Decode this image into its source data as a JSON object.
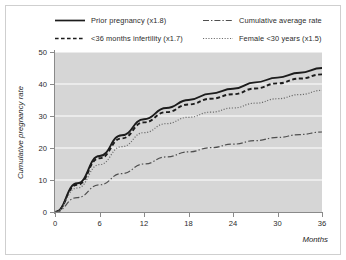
{
  "chart_data": {
    "type": "line",
    "title": "",
    "xlabel": "Months",
    "ylabel": "Cumulative pregnancy rate",
    "xlim": [
      0,
      36
    ],
    "ylim": [
      0,
      50
    ],
    "xticks": [
      0,
      6,
      12,
      18,
      24,
      30,
      36
    ],
    "yticks": [
      0,
      10,
      20,
      30,
      40,
      50
    ],
    "x": [
      0,
      3,
      6,
      9,
      12,
      15,
      18,
      21,
      24,
      27,
      30,
      33,
      36
    ],
    "grid": true,
    "grid_color": "#ffffff",
    "plot_background": "#d6d6d6",
    "legend_position": "top",
    "series": [
      {
        "name": "Prior pregnancy (x1.8)",
        "style": "solid",
        "color": "#1c1c1c",
        "values": [
          0,
          9,
          17.5,
          24,
          29,
          32.5,
          35,
          37,
          38.5,
          40.5,
          42,
          43.5,
          45
        ]
      },
      {
        "name": "<36 months infertility (x1.7)",
        "style": "dashed",
        "color": "#1c1c1c",
        "values": [
          0,
          8.5,
          16.8,
          23,
          28,
          31.2,
          33.6,
          35.4,
          36.8,
          38.6,
          40.2,
          41.7,
          43
        ]
      },
      {
        "name": "Cumulative average rate",
        "style": "dashdot",
        "color": "#4f4f4f",
        "values": [
          0,
          4.5,
          8.5,
          12,
          15,
          17.2,
          18.8,
          20.1,
          21.2,
          22.3,
          23.3,
          24.2,
          25
        ]
      },
      {
        "name": "Female <30 years (x1.5)",
        "style": "dotted",
        "color": "#6b6b6b",
        "values": [
          0,
          7.5,
          14.8,
          20.4,
          24.8,
          27.6,
          29.6,
          31.2,
          32.5,
          34.0,
          35.4,
          36.7,
          38
        ]
      }
    ]
  },
  "legend": {
    "entries": [
      {
        "label": "Prior pregnancy (x1.8)",
        "style": "solid"
      },
      {
        "label": "Cumulative average rate",
        "style": "dashdot"
      },
      {
        "label": "<36 months infertility (x1.7)",
        "style": "dashed"
      },
      {
        "label": "Female <30 years (x1.5)",
        "style": "dotted"
      }
    ]
  },
  "axes": {
    "y_title": "Cumulative pregnancy rate",
    "x_title": "Months",
    "y_tick_labels": [
      "50",
      "40",
      "30",
      "20",
      "10",
      "0"
    ],
    "x_tick_labels": [
      "0",
      "6",
      "12",
      "18",
      "24",
      "30",
      "36"
    ]
  }
}
